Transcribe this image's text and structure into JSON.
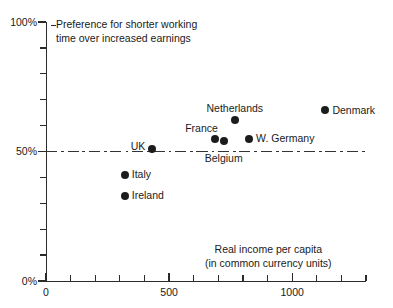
{
  "chart_data": {
    "type": "scatter",
    "title": "Preference for shorter working time over increased earnings",
    "xlabel": "Real income per capita (in common currency units)",
    "ylabel": "Preference for shorter working time over increased earnings",
    "xlim": [
      0,
      1300
    ],
    "ylim": [
      0,
      100
    ],
    "grid": false,
    "legend": "none",
    "x_tick_interval": 100,
    "y_tick_interval": 10,
    "x_labeled_ticks": [
      {
        "value": 0,
        "label": "0"
      },
      {
        "value": 500,
        "label": "500"
      },
      {
        "value": 1000,
        "label": "1000"
      }
    ],
    "y_labeled_ticks": [
      {
        "value": 0,
        "label": "0%"
      },
      {
        "value": 50,
        "label": "50%"
      },
      {
        "value": 100,
        "label": "100%"
      }
    ],
    "reference_lines": [
      {
        "axis": "y",
        "value": 50,
        "style": "dash-dot",
        "color": "#333333"
      }
    ],
    "points": [
      {
        "name": "Ireland",
        "x": 320,
        "y": 33,
        "label": "Ireland",
        "label_pos": "right"
      },
      {
        "name": "Italy",
        "x": 320,
        "y": 41,
        "label": "Italy",
        "label_pos": "right"
      },
      {
        "name": "UK",
        "x": 432,
        "y": 51,
        "label": "UK",
        "label_pos": "left"
      },
      {
        "name": "France",
        "x": 686,
        "y": 55,
        "label": "France",
        "label_pos": "above-left"
      },
      {
        "name": "Belgium",
        "x": 722,
        "y": 54,
        "label": "Belgium",
        "label_pos": "below"
      },
      {
        "name": "Netherlands",
        "x": 767,
        "y": 62,
        "label": "Netherlands",
        "label_pos": "above"
      },
      {
        "name": "W. Germany",
        "x": 825,
        "y": 55,
        "label": "W. Germany",
        "label_pos": "right"
      },
      {
        "name": "Denmark",
        "x": 1135,
        "y": 66,
        "label": "Denmark",
        "label_pos": "right"
      }
    ]
  },
  "annotations": {
    "title_text": "Preference for shorter working\ntime over increased earnings",
    "axis_caption": "Real income per capita\n(in common currency units)"
  },
  "axis_labels": {
    "y_100": "100%",
    "y_50": "50%",
    "y_0": "0%",
    "x_0": "0",
    "x_500": "500",
    "x_1000": "1000"
  },
  "colors": {
    "point": "#1c1c1c",
    "axis": "#2b2b2b",
    "reference": "#333333",
    "background": "#ffffff",
    "text": "#1a1a1a"
  }
}
